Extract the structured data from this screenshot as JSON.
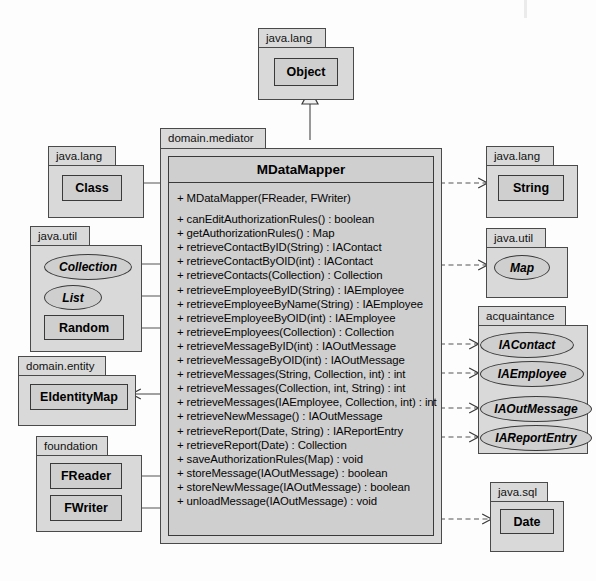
{
  "diagram": {
    "type": "uml-class-diagram",
    "colors": {
      "page_background": "#fdfdfd",
      "package_fill": "#d9d9d9",
      "class_fill": "#cfcfcf",
      "border": "#3a3a3a",
      "line": "#444444"
    }
  },
  "packages": {
    "object_pkg": {
      "name": "java.lang",
      "class": "Object"
    },
    "class_pkg": {
      "name": "java.lang",
      "class": "Class"
    },
    "javautil_left": {
      "name": "java.util",
      "members": [
        "Collection",
        "List",
        "Random"
      ]
    },
    "domain_entity": {
      "name": "domain.entity",
      "class": "EIdentityMap"
    },
    "foundation": {
      "name": "foundation",
      "members": [
        "FReader",
        "FWriter"
      ]
    },
    "mediator": {
      "name": "domain.mediator"
    },
    "string_pkg": {
      "name": "java.lang",
      "class": "String"
    },
    "map_pkg": {
      "name": "java.util",
      "class": "Map"
    },
    "acquaintance": {
      "name": "acquaintance",
      "members": [
        "IAContact",
        "IAEmployee",
        "IAOutMessage",
        "IAReportEntry"
      ]
    },
    "sql_pkg": {
      "name": "java.sql",
      "class": "Date"
    }
  },
  "main_class": {
    "name": "MDataMapper",
    "members": [
      "+ MDataMapper(FReader, FWriter)",
      "",
      "+ canEditAuthorizationRules() : boolean",
      "+ getAuthorizationRules() : Map",
      "+ retrieveContactByID(String) : IAContact",
      "+ retrieveContactByOID(int) : IAContact",
      "+ retrieveContacts(Collection) : Collection",
      "+ retrieveEmployeeByID(String) : IAEmployee",
      "+ retrieveEmployeeByName(String) : IAEmployee",
      "+ retrieveEmployeeByOID(int) : IAEmployee",
      "+ retrieveEmployees(Collection) : Collection",
      "+ retrieveMessageByID(int) : IAOutMessage",
      "+ retrieveMessageByOID(int) : IAOutMessage",
      "+ retrieveMessages(String, Collection, int) : int",
      "+ retrieveMessages(Collection, int, String) : int",
      "+ retrieveMessages(IAEmployee, Collection, int) : int",
      "+ retrieveNewMessage() : IAOutMessage",
      "+ retrieveReport(Date, String) : IAReportEntry",
      "+ retrieveReport(Date) : Collection",
      "+ saveAuthorizationRules(Map) : void",
      "+ storeMessage(IAOutMessage) : boolean",
      "+ storeNewMessage(IAOutMessage) : boolean",
      "+ unloadMessage(IAOutMessage) : void"
    ]
  },
  "relationships": [
    {
      "name": "generalization-object",
      "kind": "generalization",
      "from": "MDataMapper",
      "to": "Object"
    },
    {
      "name": "association-class",
      "kind": "association",
      "from": "MDataMapper",
      "to": "Class"
    },
    {
      "name": "association-collection",
      "kind": "association",
      "from": "MDataMapper",
      "to": "Collection"
    },
    {
      "name": "association-list",
      "kind": "association",
      "from": "MDataMapper",
      "to": "List"
    },
    {
      "name": "association-random",
      "kind": "association",
      "from": "MDataMapper",
      "to": "Random"
    },
    {
      "name": "association-eidentitymap",
      "kind": "association",
      "from": "MDataMapper",
      "to": "EIdentityMap"
    },
    {
      "name": "association-freader",
      "kind": "association",
      "from": "MDataMapper",
      "to": "FReader"
    },
    {
      "name": "association-fwriter",
      "kind": "association",
      "from": "MDataMapper",
      "to": "FWriter"
    },
    {
      "name": "dependency-string",
      "kind": "dependency",
      "from": "MDataMapper",
      "to": "String"
    },
    {
      "name": "dependency-map",
      "kind": "dependency",
      "from": "MDataMapper",
      "to": "Map"
    },
    {
      "name": "dependency-iacontact",
      "kind": "dependency",
      "from": "MDataMapper",
      "to": "IAContact"
    },
    {
      "name": "dependency-iaemployee",
      "kind": "dependency",
      "from": "MDataMapper",
      "to": "IAEmployee"
    },
    {
      "name": "dependency-iaoutmessage",
      "kind": "dependency",
      "from": "MDataMapper",
      "to": "IAOutMessage"
    },
    {
      "name": "dependency-iareportentry",
      "kind": "dependency",
      "from": "MDataMapper",
      "to": "IAReportEntry"
    },
    {
      "name": "dependency-date",
      "kind": "dependency",
      "from": "MDataMapper",
      "to": "Date"
    }
  ]
}
